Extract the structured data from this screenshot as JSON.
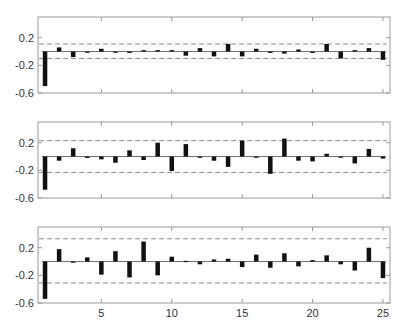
{
  "figure": {
    "width": 405,
    "height": 331,
    "colors": {
      "bar": "#111111",
      "axis": "#9a9a9a",
      "zero_line": "#6f6f6f",
      "band": "#8c8c8c",
      "tick_label": "#333333",
      "background": "#ffffff"
    }
  },
  "chart_data": [
    {
      "type": "bar",
      "panel": 1,
      "title": "",
      "xlabel": "",
      "ylabel": "",
      "x": [
        1,
        2,
        3,
        4,
        5,
        6,
        7,
        8,
        9,
        10,
        11,
        12,
        13,
        14,
        15,
        16,
        17,
        18,
        19,
        20,
        21,
        22,
        23,
        24,
        25
      ],
      "values": [
        -0.5,
        0.06,
        -0.08,
        -0.01,
        0.04,
        -0.01,
        -0.02,
        0.02,
        0.02,
        0.02,
        -0.06,
        0.05,
        -0.07,
        0.11,
        -0.07,
        0.04,
        -0.02,
        -0.03,
        0.03,
        -0.02,
        0.11,
        -0.1,
        0.02,
        0.05,
        -0.12
      ],
      "confidence_band": [
        -0.1,
        0.11
      ],
      "xlim": [
        0.5,
        25.5
      ],
      "ylim": [
        -0.6,
        0.5
      ],
      "yticks": [
        0.2,
        -0.2,
        -0.6
      ],
      "ytick_labels": [
        "0.2",
        "-0.2",
        "-0.6"
      ],
      "xticks": [
        5,
        10,
        15,
        20,
        25
      ],
      "xtick_labels": [],
      "grid": false,
      "legend": null
    },
    {
      "type": "bar",
      "panel": 2,
      "title": "",
      "xlabel": "",
      "ylabel": "",
      "x": [
        1,
        2,
        3,
        4,
        5,
        6,
        7,
        8,
        9,
        10,
        11,
        12,
        13,
        14,
        15,
        16,
        17,
        18,
        19,
        20,
        21,
        22,
        23,
        24,
        25
      ],
      "values": [
        -0.48,
        -0.06,
        0.12,
        -0.02,
        -0.04,
        -0.09,
        0.09,
        -0.05,
        0.2,
        -0.21,
        0.18,
        0.0,
        -0.06,
        -0.15,
        0.23,
        0.0,
        -0.25,
        0.26,
        -0.06,
        -0.07,
        0.04,
        0.0,
        -0.1,
        0.11,
        -0.03
      ],
      "confidence_band": [
        -0.23,
        0.23
      ],
      "xlim": [
        0.5,
        25.5
      ],
      "ylim": [
        -0.6,
        0.5
      ],
      "yticks": [
        0.2,
        -0.2,
        -0.6
      ],
      "ytick_labels": [
        "0.2",
        "-0.2",
        "-0.6"
      ],
      "xticks": [
        5,
        10,
        15,
        20,
        25
      ],
      "xtick_labels": [],
      "grid": false,
      "legend": null
    },
    {
      "type": "bar",
      "panel": 3,
      "title": "",
      "xlabel": "",
      "ylabel": "",
      "x": [
        1,
        2,
        3,
        4,
        5,
        6,
        7,
        8,
        9,
        10,
        11,
        12,
        13,
        14,
        15,
        16,
        17,
        18,
        19,
        20,
        21,
        22,
        23,
        24,
        25
      ],
      "values": [
        -0.54,
        0.18,
        0.0,
        0.06,
        -0.19,
        0.15,
        -0.23,
        0.29,
        -0.2,
        0.07,
        0.01,
        -0.04,
        0.03,
        0.04,
        -0.08,
        0.1,
        -0.09,
        0.12,
        -0.07,
        0.02,
        0.09,
        -0.04,
        -0.13,
        0.2,
        -0.24
      ],
      "confidence_band": [
        -0.31,
        0.33
      ],
      "xlim": [
        0.5,
        25.5
      ],
      "ylim": [
        -0.6,
        0.5
      ],
      "yticks": [
        0.2,
        -0.2,
        -0.6
      ],
      "ytick_labels": [
        "0.2",
        "-0.2",
        "-0.6"
      ],
      "xticks": [
        5,
        10,
        15,
        20,
        25
      ],
      "xtick_labels": [
        "5",
        "10",
        "15",
        "20",
        "25"
      ],
      "grid": false,
      "legend": null
    }
  ],
  "layout": {
    "panels": [
      {
        "left": 38,
        "right": 390,
        "top": 17,
        "bottom": 93
      },
      {
        "left": 38,
        "right": 390,
        "top": 122,
        "bottom": 198
      },
      {
        "left": 38,
        "right": 390,
        "top": 227,
        "bottom": 303
      }
    ],
    "bar_width": 4.5
  }
}
